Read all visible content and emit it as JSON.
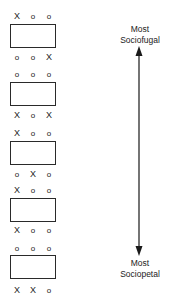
{
  "diagram": {
    "type": "seating-arrangement-continuum",
    "legend_symbols": {
      "occupied": "X",
      "empty": "o"
    },
    "arrangements": [
      {
        "top": [
          "X",
          "o",
          "o"
        ],
        "bottom": [
          "o",
          "o",
          "X"
        ]
      },
      {
        "top": [
          "o",
          "o",
          "o"
        ],
        "bottom": [
          "X",
          "o",
          "X"
        ]
      },
      {
        "top": [
          "X",
          "o",
          "o"
        ],
        "bottom": [
          "o",
          "X",
          "o"
        ]
      },
      {
        "top": [
          "X",
          "o",
          "o"
        ],
        "bottom": [
          "X",
          "o",
          "o"
        ]
      },
      {
        "top": [
          "o",
          "o",
          "o"
        ],
        "bottom": [
          "X",
          "X",
          "o"
        ]
      }
    ],
    "scale": {
      "top_label_line1": "Most",
      "top_label_line2": "Sociofugal",
      "bottom_label_line1": "Most",
      "bottom_label_line2": "Sociopetal"
    },
    "colors": {
      "line": "#2a2a2a",
      "background": "#ffffff"
    }
  }
}
